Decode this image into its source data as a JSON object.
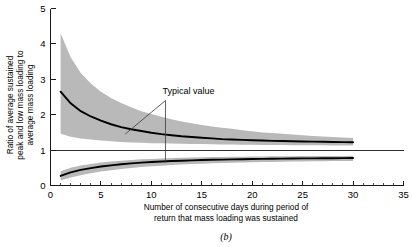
{
  "figure": {
    "caption": "(b)",
    "annotation": {
      "label": "Typical value",
      "x_value": 11.4
    }
  },
  "chart_data": {
    "type": "line",
    "title": "",
    "subtitle": "",
    "xlabel": "Number of consecutive days during period of return that mass loading was sustained",
    "xlabel_line1": "Number of consecutive days during period of",
    "xlabel_line2": "return that mass loading was sustained",
    "ylabel": "Ratio of average sustained peak and low mass loading to average mass loading",
    "ylabel_line1": "Ratio of average sustained",
    "ylabel_line2": "peak and low mass loading to",
    "ylabel_line3": "average mass loading",
    "xlim": [
      0,
      35
    ],
    "ylim": [
      0,
      5
    ],
    "xticks": [
      0,
      5,
      10,
      15,
      20,
      25,
      30,
      35
    ],
    "xticklabels": [
      "0",
      "5",
      "10",
      "15",
      "20",
      "25",
      "30",
      "35"
    ],
    "xminor_step": 1,
    "yticks": [
      0,
      1,
      2,
      3,
      4,
      5
    ],
    "yticklabels": [
      "0",
      "1",
      "2",
      "3",
      "4",
      "5"
    ],
    "grid": false,
    "legend": "none",
    "reference_line": {
      "y": 1,
      "x_from": 0,
      "x_to": 35
    },
    "band_color": "#b9b9b9",
    "line_color": "#000000",
    "x": [
      1,
      2,
      3,
      4,
      5,
      6,
      7,
      8,
      9,
      10,
      11,
      12,
      13,
      14,
      15,
      16,
      17,
      18,
      19,
      20,
      21,
      22,
      23,
      24,
      25,
      26,
      27,
      28,
      29,
      30
    ],
    "series": [
      {
        "name": "Sustained peak ratio (typical value)",
        "role": "upper-curve",
        "values": [
          2.65,
          2.32,
          2.1,
          1.95,
          1.83,
          1.73,
          1.65,
          1.59,
          1.54,
          1.49,
          1.45,
          1.42,
          1.39,
          1.37,
          1.35,
          1.33,
          1.31,
          1.3,
          1.29,
          1.28,
          1.27,
          1.26,
          1.255,
          1.25,
          1.245,
          1.24,
          1.235,
          1.23,
          1.225,
          1.22
        ]
      },
      {
        "name": "Sustained peak ratio upper bound",
        "role": "upper-band-top",
        "values": [
          4.3,
          3.62,
          3.18,
          2.88,
          2.65,
          2.47,
          2.33,
          2.21,
          2.1,
          2.02,
          1.94,
          1.87,
          1.81,
          1.76,
          1.71,
          1.67,
          1.63,
          1.6,
          1.56,
          1.53,
          1.5,
          1.48,
          1.46,
          1.44,
          1.42,
          1.4,
          1.385,
          1.37,
          1.355,
          1.34
        ]
      },
      {
        "name": "Sustained peak ratio lower bound",
        "role": "upper-band-bottom",
        "values": [
          1.46,
          1.38,
          1.33,
          1.3,
          1.27,
          1.25,
          1.23,
          1.215,
          1.205,
          1.195,
          1.19,
          1.185,
          1.18,
          1.175,
          1.17,
          1.165,
          1.16,
          1.155,
          1.15,
          1.148,
          1.146,
          1.144,
          1.142,
          1.14,
          1.138,
          1.136,
          1.134,
          1.132,
          1.13,
          1.128
        ]
      },
      {
        "name": "Sustained low ratio (typical value)",
        "role": "lower-curve",
        "values": [
          0.27,
          0.37,
          0.44,
          0.49,
          0.535,
          0.57,
          0.6,
          0.625,
          0.645,
          0.662,
          0.677,
          0.69,
          0.701,
          0.711,
          0.719,
          0.726,
          0.732,
          0.738,
          0.743,
          0.748,
          0.752,
          0.756,
          0.759,
          0.762,
          0.765,
          0.767,
          0.769,
          0.771,
          0.773,
          0.775
        ]
      },
      {
        "name": "Sustained low ratio upper bound",
        "role": "lower-band-top",
        "values": [
          0.4,
          0.5,
          0.565,
          0.61,
          0.648,
          0.678,
          0.702,
          0.722,
          0.738,
          0.752,
          0.764,
          0.774,
          0.783,
          0.79,
          0.797,
          0.802,
          0.807,
          0.811,
          0.815,
          0.818,
          0.821,
          0.824,
          0.826,
          0.828,
          0.83,
          0.832,
          0.834,
          0.835,
          0.836,
          0.838
        ]
      },
      {
        "name": "Sustained low ratio lower bound",
        "role": "lower-band-bottom",
        "values": [
          0.14,
          0.225,
          0.29,
          0.345,
          0.392,
          0.432,
          0.466,
          0.495,
          0.52,
          0.542,
          0.561,
          0.578,
          0.592,
          0.605,
          0.616,
          0.626,
          0.635,
          0.643,
          0.65,
          0.657,
          0.662,
          0.667,
          0.672,
          0.676,
          0.68,
          0.683,
          0.686,
          0.689,
          0.691,
          0.694
        ]
      }
    ]
  }
}
